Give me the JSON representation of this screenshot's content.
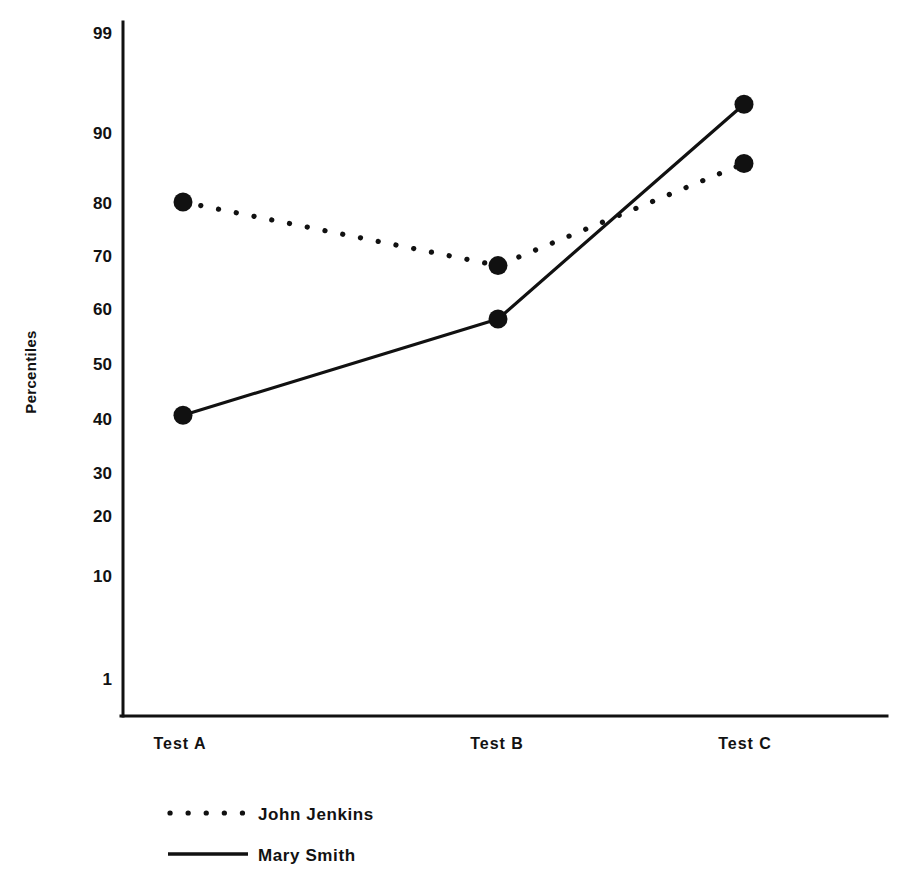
{
  "chart_data": {
    "type": "line",
    "title": "",
    "xlabel": "",
    "ylabel": "Percentiles",
    "categories": [
      "Test A",
      "Test B",
      "Test C"
    ],
    "yticks": [
      99,
      90,
      80,
      70,
      60,
      50,
      40,
      30,
      20,
      10,
      1
    ],
    "ylim": [
      1,
      99
    ],
    "y_scale": "normal-probability",
    "grid": false,
    "legend_position": "bottom-left",
    "series": [
      {
        "name": "John Jenkins",
        "style": "dotted",
        "marker": "filled-circle",
        "values": [
          80,
          68,
          85.5
        ]
      },
      {
        "name": "Mary Smith",
        "style": "solid",
        "marker": "filled-circle",
        "values": [
          40.5,
          58,
          92.5
        ]
      }
    ]
  },
  "axes": {
    "y_title": "Percentiles",
    "y_tick_labels": [
      "99",
      "90",
      "80",
      "70",
      "60",
      "50",
      "40",
      "30",
      "20",
      "10",
      "1"
    ],
    "x_tick_labels": [
      "Test A",
      "Test B",
      "Test C"
    ]
  },
  "legend": {
    "entries": [
      {
        "label": "John Jenkins",
        "style": "dotted"
      },
      {
        "label": "Mary Smith",
        "style": "solid"
      }
    ]
  }
}
